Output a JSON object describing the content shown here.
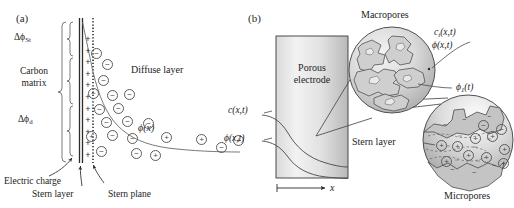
{
  "figure": {
    "panels": [
      {
        "id": "a",
        "label": "(a)"
      },
      {
        "id": "b",
        "label": "(b)"
      }
    ]
  },
  "panel_a": {
    "title": "(a)",
    "labels": {
      "delta_phi_st": "ΔϕSt",
      "delta_phi_st_main": "Δϕ",
      "delta_phi_st_sub": "St",
      "carbon_matrix_line1": "Carbon",
      "carbon_matrix_line2": "matrix",
      "delta_phi_d_main": "Δϕ",
      "delta_phi_d_sub": "d",
      "diffuse_layer": "Diffuse layer",
      "phi_x": "ϕ(x)",
      "electric_charge": "Electric charge",
      "stern_layer": "Stern layer",
      "stern_plane": "Stern plane"
    },
    "carbon_charges": {
      "symbol": "+",
      "count": 11
    },
    "ions": [
      {
        "sign": "−",
        "x": 91,
        "y": 48
      },
      {
        "sign": "−",
        "x": 102,
        "y": 59
      },
      {
        "sign": "−",
        "x": 98,
        "y": 75
      },
      {
        "sign": "−",
        "x": 88,
        "y": 88
      },
      {
        "sign": "−",
        "x": 107,
        "y": 90
      },
      {
        "sign": "−",
        "x": 124,
        "y": 89
      },
      {
        "sign": "−",
        "x": 94,
        "y": 104
      },
      {
        "sign": "−",
        "x": 113,
        "y": 103
      },
      {
        "sign": "−",
        "x": 101,
        "y": 117
      },
      {
        "sign": "−",
        "x": 122,
        "y": 116
      },
      {
        "sign": "−",
        "x": 143,
        "y": 118
      },
      {
        "sign": "+",
        "x": 86,
        "y": 131
      },
      {
        "sign": "−",
        "x": 107,
        "y": 130
      },
      {
        "sign": "−",
        "x": 127,
        "y": 133
      },
      {
        "sign": "+",
        "x": 161,
        "y": 132
      },
      {
        "sign": "−",
        "x": 96,
        "y": 146
      },
      {
        "sign": "−",
        "x": 131,
        "y": 148
      },
      {
        "sign": "+",
        "x": 150,
        "y": 150
      },
      {
        "sign": "+",
        "x": 196,
        "y": 134
      },
      {
        "sign": "−",
        "x": 216,
        "y": 142
      },
      {
        "sign": "+",
        "x": 233,
        "y": 135
      }
    ]
  },
  "panel_b": {
    "title": "(b)",
    "labels": {
      "porous_electrode_line1": "Porous",
      "porous_electrode_line2": "electrode",
      "macropores": "Macropores",
      "micropores": "Micropores",
      "stern_layer": "Stern layer",
      "c_i_xt_main": "c",
      "c_i_xt_sub": "i",
      "c_i_xt_rest": "(x,t)",
      "phi_xt": "ϕ(x,t)",
      "phi_1_t_main": "ϕ",
      "phi_1_t_sub": "1",
      "phi_1_t_rest": "(t)",
      "c_xt": "c(x,t)",
      "phi_xt_left": "ϕ(x,t)",
      "x_axis": "x"
    },
    "micropore_ions": [
      {
        "sign": "+",
        "x": 436,
        "y": 140
      },
      {
        "sign": "+",
        "x": 452,
        "y": 141
      },
      {
        "sign": "+",
        "x": 470,
        "y": 133
      },
      {
        "sign": "+",
        "x": 487,
        "y": 131
      },
      {
        "sign": "+",
        "x": 499,
        "y": 144
      },
      {
        "sign": "−",
        "x": 478,
        "y": 120
      },
      {
        "sign": "−",
        "x": 496,
        "y": 124
      },
      {
        "sign": "+",
        "x": 441,
        "y": 156
      },
      {
        "sign": "+",
        "x": 463,
        "y": 150
      },
      {
        "sign": "+",
        "x": 481,
        "y": 152
      },
      {
        "sign": "+",
        "x": 498,
        "y": 158
      }
    ]
  },
  "colors": {
    "ink": "#232323",
    "line": "#4a4a4a",
    "electrode_fill_light": "#efefef",
    "electrode_fill_dark": "#c9c9c9",
    "pore_fill": "#dcdcdc",
    "pore_fill_dark": "#b5b5b5",
    "white": "#ffffff"
  }
}
